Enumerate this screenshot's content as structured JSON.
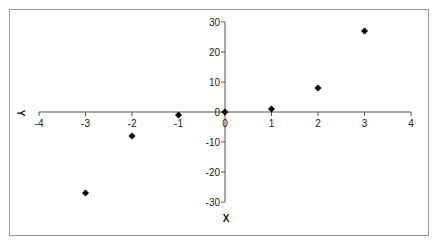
{
  "chart_data": {
    "type": "scatter",
    "title": "",
    "xlabel": "Y",
    "ylabel": "X",
    "x": [
      -3,
      -2,
      -1,
      0,
      1,
      2,
      3
    ],
    "y": [
      -27,
      -8,
      -1,
      0,
      1,
      8,
      27
    ],
    "series": [
      {
        "name": "y = x^3",
        "marker": "diamond",
        "color": "#000000",
        "points": [
          [
            -3,
            -27
          ],
          [
            -2,
            -8
          ],
          [
            -1,
            -1
          ],
          [
            0,
            0
          ],
          [
            1,
            1
          ],
          [
            2,
            8
          ],
          [
            3,
            27
          ]
        ]
      }
    ],
    "xlim": [
      -4,
      4
    ],
    "ylim": [
      -30,
      30
    ],
    "xticks": [
      -4,
      -3,
      -2,
      -1,
      0,
      1,
      2,
      3,
      4
    ],
    "yticks": [
      30,
      20,
      10,
      0,
      -10,
      -20,
      -30
    ],
    "grid": false,
    "legend": null
  },
  "colors": {
    "frame": "#9a9a9a",
    "axis": "#555555",
    "marker": "#000000"
  }
}
